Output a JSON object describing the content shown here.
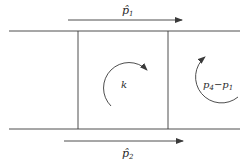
{
  "diagram": {
    "labels": {
      "top_arrow": "p̂",
      "top_arrow_sub": "1",
      "bottom_arrow": "p̂",
      "bottom_arrow_sub": "2",
      "center_loop": "k",
      "right_loop_a": "p",
      "right_loop_a_sub": "4",
      "right_loop_minus": "−",
      "right_loop_b": "p",
      "right_loop_b_sub": "1"
    },
    "colors": {
      "line": "#3a3a3a",
      "background": "#ffffff"
    }
  }
}
